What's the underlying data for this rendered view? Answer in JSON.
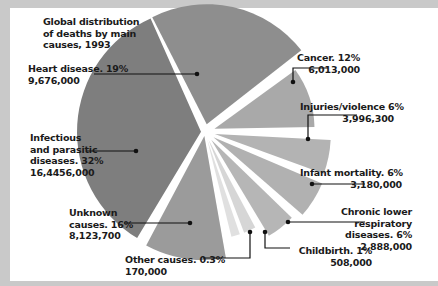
{
  "chart_data": {
    "type": "pie",
    "title": "Global distribution of deaths by main causes, 1993",
    "exploded": true,
    "slices": [
      {
        "label": "Heart disease",
        "percent": 19,
        "value": 9676000,
        "value_text": "9,676,000",
        "color": "#8e8e8e"
      },
      {
        "label": "Cancer",
        "percent": 12,
        "value": 6013000,
        "value_text": "6,013,000",
        "color": "#a9a9a9"
      },
      {
        "label": "Injuries/violence",
        "percent": 6,
        "value": 3996300,
        "value_text": "3,996,300",
        "color": "#b3b3b3"
      },
      {
        "label": "Infant mortality",
        "percent": 6,
        "value": 3180000,
        "value_text": "3,180,000",
        "color": "#b1b1b1"
      },
      {
        "label": "Chronic lower respiratory diseases",
        "percent": 6,
        "value": 2888000,
        "value_text": "2,888,000",
        "color": "#b6b6b6"
      },
      {
        "label": "Childbirth",
        "percent": 1,
        "value": 508000,
        "value_text": "508,000",
        "color": "#d6d6d6"
      },
      {
        "label": "Other causes",
        "percent": 0.3,
        "value": 170000,
        "value_text": "170,000",
        "color": "#e0e0e0"
      },
      {
        "label": "Unknown causes",
        "percent": 16,
        "value": 8123700,
        "value_text": "8,123,700",
        "color": "#9b9b9b"
      },
      {
        "label": "Infectious and parasitic diseases",
        "percent": 32,
        "value": 164456000,
        "value_text": "16,4456,000",
        "color": "#7e7e7e"
      }
    ]
  },
  "title_lines": [
    "Global distribution",
    "of deaths by main",
    "causes, 1993"
  ],
  "labels": {
    "heart": [
      "Heart disease. 19%",
      "9,676,000"
    ],
    "cancer": [
      "Cancer. 12%",
      "6,013,000"
    ],
    "injuries": [
      "Injuries/violence 6%",
      "3,996,300"
    ],
    "infant": [
      "Infant mortality. 6%",
      "3,180,000"
    ],
    "chronic": [
      "Chronic lower",
      "respiratory",
      "diseases. 6%",
      "2,888,000"
    ],
    "childbirth": [
      "Childbirth. 1%",
      "508,000"
    ],
    "other": [
      "Other causes. 0.3%",
      "170,000"
    ],
    "unknown": [
      "Unknown",
      "causes. 16%",
      "8,123,700"
    ],
    "infectious": [
      "Infectious",
      "and parasitic",
      "diseases. 32%",
      "16,4456,000"
    ]
  }
}
